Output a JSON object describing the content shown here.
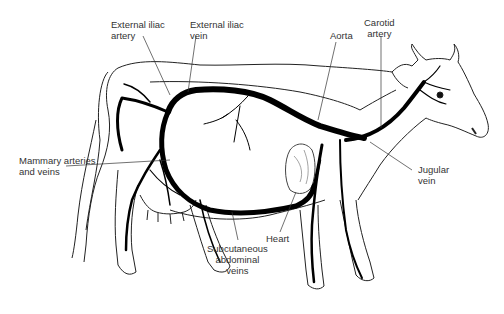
{
  "diagram": {
    "labels": {
      "external_iliac_artery": [
        "External iliac",
        "artery"
      ],
      "external_iliac_vein": [
        "External iliac",
        "vein"
      ],
      "aorta": [
        "Aorta"
      ],
      "carotid_artery": [
        "Carotid",
        "artery"
      ],
      "mammary": [
        "Mammary arteries",
        "and veins"
      ],
      "jugular_vein": [
        "Jugular",
        "vein"
      ],
      "heart": [
        "Heart"
      ],
      "subcutaneous": [
        "Subcutaneous",
        "abdominal",
        "veins"
      ]
    },
    "colors": {
      "vessel": "#000000",
      "outline": "#222222",
      "label": "#333333",
      "background": "#ffffff"
    }
  }
}
